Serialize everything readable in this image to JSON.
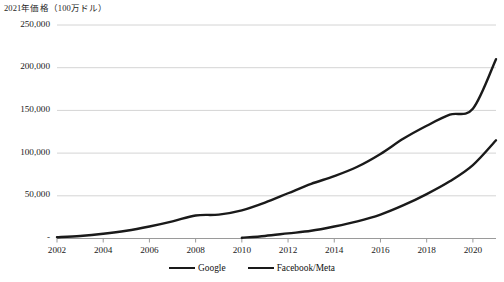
{
  "chart_data": {
    "type": "line",
    "title": "2021年価格（100万ドル）",
    "xlabel": "",
    "ylabel": "",
    "x": [
      2002,
      2003,
      2004,
      2005,
      2006,
      2007,
      2008,
      2009,
      2010,
      2011,
      2012,
      2013,
      2014,
      2015,
      2016,
      2017,
      2018,
      2019,
      2020,
      2021
    ],
    "series": [
      {
        "name": "Google",
        "values": [
          1500,
          3000,
          5500,
          9000,
          14000,
          20000,
          27000,
          28000,
          33000,
          42000,
          53000,
          64000,
          73000,
          84000,
          99000,
          117000,
          132000,
          145000,
          152000,
          210000
        ]
      },
      {
        "name": "Facebook/Meta",
        "values": [
          null,
          null,
          null,
          null,
          null,
          null,
          null,
          null,
          800,
          3000,
          6000,
          9000,
          14000,
          20000,
          28000,
          39000,
          52000,
          67000,
          86000,
          115000
        ]
      }
    ],
    "ylim": [
      0,
      250000
    ],
    "yticks": [
      0,
      50000,
      100000,
      150000,
      200000,
      250000
    ],
    "ytick_labels": [
      "-",
      "50,000",
      "100,000",
      "150,000",
      "200,000",
      "250,000"
    ],
    "xticks": [
      2002,
      2004,
      2006,
      2008,
      2010,
      2012,
      2014,
      2016,
      2018,
      2020
    ],
    "xtick_labels": [
      "2002",
      "2004",
      "2006",
      "2008",
      "2010",
      "2012",
      "2014",
      "2016",
      "2018",
      "2020"
    ],
    "xlim": [
      2002,
      2021
    ],
    "grid": "horizontal",
    "legend_position": "bottom",
    "line_color": "#1a1a1a",
    "grid_color": "#d4d4d4",
    "axis_color": "#9a9a9a"
  },
  "legend": {
    "items": [
      {
        "label": "Google"
      },
      {
        "label": "Facebook/Meta"
      }
    ]
  }
}
